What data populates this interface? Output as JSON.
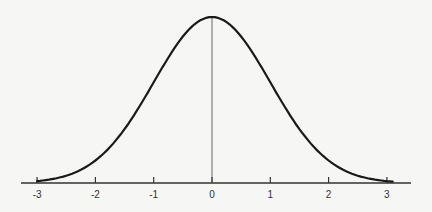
{
  "chart_data": {
    "type": "line",
    "title": "",
    "xlabel": "",
    "ylabel": "",
    "x_ticks": [
      -3,
      -2,
      -1,
      0,
      1,
      2,
      3
    ],
    "x_tick_labels": [
      "-3",
      "-2",
      "-1",
      "0",
      "1",
      "2",
      "3"
    ],
    "xlim": [
      -3.1,
      3.1
    ],
    "grid": false,
    "legend": null,
    "series": [
      {
        "name": "normal-pdf",
        "mean": 0,
        "sd": 1,
        "x": [
          -3,
          -2.5,
          -2,
          -1.5,
          -1,
          -0.5,
          0,
          0.5,
          1,
          1.5,
          2,
          2.5,
          3
        ],
        "y": [
          0.0044,
          0.0175,
          0.054,
          0.1295,
          0.242,
          0.3521,
          0.3989,
          0.3521,
          0.242,
          0.1295,
          0.054,
          0.0175,
          0.0044
        ]
      }
    ],
    "annotations": [
      {
        "type": "vertical-line",
        "x": 0,
        "label": ""
      }
    ],
    "colors": {
      "curve": "#1a1a1a",
      "axis": "#333333",
      "mean_line": "#888888",
      "background": "#f6f6f4"
    }
  }
}
